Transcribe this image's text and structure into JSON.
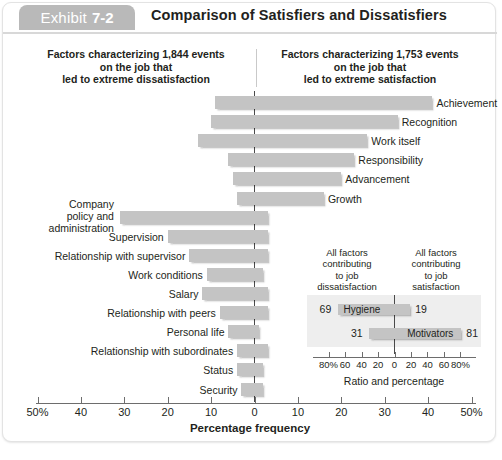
{
  "header": {
    "exhibit_word": "Exhibit",
    "exhibit_number": "7-2",
    "title": "Comparison of Satisfiers and Dissatisfiers",
    "tab_color": "#b9b9b9"
  },
  "captions": {
    "left": "Factors characterizing 1,844 events on the job that led to extreme dissatisfaction",
    "left_lines": [
      "Factors characterizing 1,844 events",
      "on the job that",
      "led to extreme dissatisfaction"
    ],
    "right": "Factors characterizing 1,753 events on the job that led to extreme satisfaction",
    "right_lines": [
      "Factors characterizing 1,753 events",
      "on the job that",
      "led to extreme satisfaction"
    ]
  },
  "chart_data": {
    "type": "bar",
    "title": "Comparison of Satisfiers and Dissatisfiers",
    "xlabel": "Percentage frequency",
    "ylabel": "",
    "orientation": "horizontal-diverging",
    "xlim": [
      -50,
      50
    ],
    "xticks": [
      -50,
      -40,
      -30,
      -20,
      -10,
      0,
      10,
      20,
      30,
      40,
      50
    ],
    "xticklabels": [
      "50%",
      "40",
      "30",
      "20",
      "10",
      "0",
      "10",
      "20",
      "30",
      "40",
      "50%"
    ],
    "grid": false,
    "legend": "none",
    "bar_color": "#c4c4c4",
    "series": [
      {
        "name": "Dissatisfaction (left of zero)",
        "note": "negative extent"
      },
      {
        "name": "Satisfaction (right of zero)",
        "note": "positive extent"
      }
    ],
    "factors": [
      {
        "label": "Achievement",
        "side": "satisfier",
        "left": -9,
        "right": 41
      },
      {
        "label": "Recognition",
        "side": "satisfier",
        "left": -10,
        "right": 33
      },
      {
        "label": "Work itself",
        "side": "satisfier",
        "left": -13,
        "right": 26
      },
      {
        "label": "Responsibility",
        "side": "satisfier",
        "left": -6,
        "right": 23
      },
      {
        "label": "Advancement",
        "side": "satisfier",
        "left": -5,
        "right": 20
      },
      {
        "label": "Growth",
        "side": "satisfier",
        "left": -4,
        "right": 16
      },
      {
        "label": "Company policy and administration",
        "side": "dissatisfier",
        "left": -31,
        "right": 3
      },
      {
        "label": "Supervision",
        "side": "dissatisfier",
        "left": -20,
        "right": 3
      },
      {
        "label": "Relationship with supervisor",
        "side": "dissatisfier",
        "left": -15,
        "right": 3
      },
      {
        "label": "Work conditions",
        "side": "dissatisfier",
        "left": -11,
        "right": 2
      },
      {
        "label": "Salary",
        "side": "dissatisfier",
        "left": -12,
        "right": 3
      },
      {
        "label": "Relationship with peers",
        "side": "dissatisfier",
        "left": -8,
        "right": 3
      },
      {
        "label": "Personal life",
        "side": "dissatisfier",
        "left": -6,
        "right": 1
      },
      {
        "label": "Relationship with subordinates",
        "side": "dissatisfier",
        "left": -4,
        "right": 3
      },
      {
        "label": "Status",
        "side": "dissatisfier",
        "left": -4,
        "right": 2
      },
      {
        "label": "Security",
        "side": "dissatisfier",
        "left": -3,
        "right": 2
      }
    ]
  },
  "inset": {
    "caption_left": "All factors contributing to job dissatisfaction",
    "caption_left_lines": [
      "All factors",
      "contributing",
      "to job",
      "dissatisfaction"
    ],
    "caption_right": "All factors contributing to job satisfaction",
    "caption_right_lines": [
      "All factors",
      "contributing",
      "to job",
      "satisfaction"
    ],
    "xlabel": "Ratio and percentage",
    "xticklabels": [
      "80%",
      "60",
      "40",
      "20",
      "0",
      "20",
      "40",
      "60",
      "80%"
    ],
    "xticks": [
      -80,
      -60,
      -40,
      -20,
      0,
      20,
      40,
      60,
      80
    ],
    "xlim": [
      -90,
      90
    ],
    "panel_color": "#eeeeee",
    "bars": [
      {
        "label": "Hygiene",
        "left_value": 69,
        "right_value": 19,
        "left_label": "69",
        "right_label": "19"
      },
      {
        "label": "Motivators",
        "left_value": 31,
        "right_value": 81,
        "left_label": "31",
        "right_label": "81"
      }
    ]
  }
}
